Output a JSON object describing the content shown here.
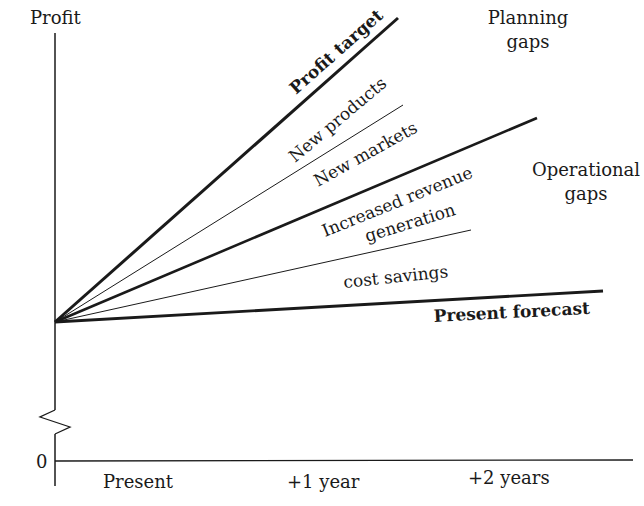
{
  "axes": {
    "y_label": "Profit",
    "zero_label": "0",
    "x_ticks": [
      "Present",
      "+1 year",
      "+2 years"
    ]
  },
  "lines": [
    {
      "id": "profit_target",
      "label": "Profit target",
      "weight": "bold"
    },
    {
      "id": "new_products",
      "label": "New products",
      "weight": "thin"
    },
    {
      "id": "new_markets",
      "label": "New markets",
      "weight": "bold"
    },
    {
      "id": "increased_revenue",
      "label_line1": "Increased revenue",
      "label_line2": "generation",
      "weight": "thin"
    },
    {
      "id": "cost_savings",
      "label": "cost savings",
      "weight": "thin"
    },
    {
      "id": "present_forecast",
      "label": "Present forecast",
      "weight": "bold"
    }
  ],
  "annotations": {
    "planning_gaps_line1": "Planning",
    "planning_gaps_line2": "gaps",
    "operational_gaps_line1": "Operational",
    "operational_gaps_line2": "gaps"
  },
  "colors": {
    "ink": "#1a1a1a",
    "background": "#ffffff"
  }
}
